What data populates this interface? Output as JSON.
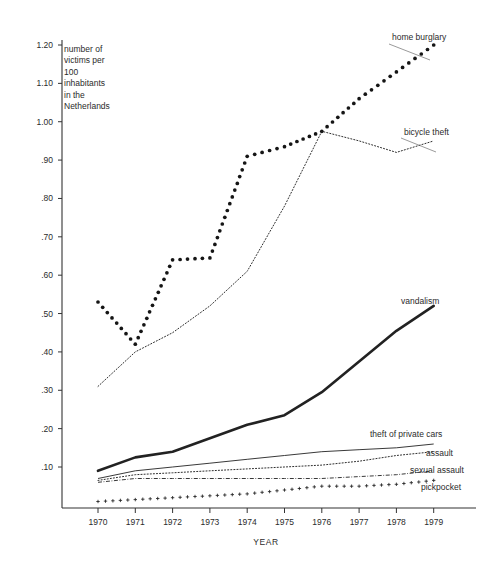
{
  "annotation": {
    "lines": [
      "number of",
      "victims per",
      "100",
      "inhabitants",
      "in the",
      "Netherlands"
    ]
  },
  "axes": {
    "x_title": "YEAR",
    "y_tick_labels": [
      "1.20",
      "1.10",
      "1.00",
      ".90",
      ".80",
      ".70",
      ".60",
      ".50",
      ".40",
      ".30",
      ".20",
      ".10"
    ],
    "x_tick_labels": [
      "1970",
      "1971",
      "1972",
      "1973",
      "1974",
      "1975",
      "1976",
      "1977",
      "1978",
      "1979"
    ]
  },
  "colors": {
    "ink": "#222222",
    "axis": "#333333",
    "background": "#ffffff"
  },
  "chart_data": {
    "type": "line",
    "title": "",
    "subtitle": "",
    "xlabel": "YEAR",
    "ylabel": "number of victims per 100 inhabitants in the Netherlands",
    "x": [
      1970,
      1971,
      1972,
      1973,
      1974,
      1975,
      1976,
      1977,
      1978,
      1979
    ],
    "xlim": [
      1969.6,
      1979.6
    ],
    "ylim": [
      0.0,
      1.24
    ],
    "grid": false,
    "legend": "inline-right-labels",
    "y_ticks": [
      1.2,
      1.1,
      1.0,
      0.9,
      0.8,
      0.7,
      0.6,
      0.5,
      0.4,
      0.3,
      0.2,
      0.1
    ],
    "series": [
      {
        "name": "home burglary",
        "style": "bold-dotted",
        "label": "home burglary",
        "values": [
          0.53,
          0.42,
          0.64,
          0.645,
          0.91,
          0.935,
          0.975,
          1.06,
          1.13,
          1.2
        ]
      },
      {
        "name": "bicycle theft",
        "style": "fine-dotted",
        "label": "bicycle theft",
        "values": [
          0.31,
          0.4,
          0.45,
          0.52,
          0.61,
          0.78,
          0.975,
          0.95,
          0.92,
          0.95
        ]
      },
      {
        "name": "vandalism",
        "style": "thick-solid",
        "label": "vandalism",
        "values": [
          0.09,
          0.125,
          0.14,
          0.175,
          0.21,
          0.235,
          0.295,
          0.375,
          0.455,
          0.52
        ]
      },
      {
        "name": "theft of private cars",
        "style": "thin-solid",
        "label": "theft of private cars",
        "values": [
          0.07,
          0.09,
          0.1,
          0.11,
          0.12,
          0.13,
          0.14,
          0.145,
          0.15,
          0.16
        ]
      },
      {
        "name": "assault",
        "style": "fine-dotted",
        "label": "assault",
        "values": [
          0.065,
          0.08,
          0.085,
          0.09,
          0.095,
          0.1,
          0.105,
          0.115,
          0.13,
          0.14
        ]
      },
      {
        "name": "sexual assault",
        "style": "dash-dot",
        "label": "sexual assault",
        "values": [
          0.06,
          0.07,
          0.07,
          0.07,
          0.07,
          0.07,
          0.07,
          0.075,
          0.08,
          0.09
        ]
      },
      {
        "name": "pickpocket",
        "style": "plus-markers",
        "label": "pickpocket",
        "values": [
          0.01,
          0.015,
          0.02,
          0.025,
          0.03,
          0.04,
          0.05,
          0.05,
          0.055,
          0.065
        ]
      }
    ]
  }
}
